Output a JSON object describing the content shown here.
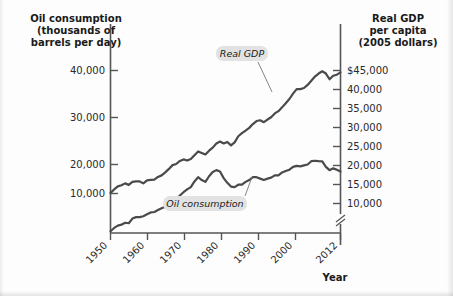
{
  "chart_data": {
    "type": "line",
    "title": "",
    "xlabel": "Year",
    "ylabel_left": "Oil consumption (thousands of barrels per day)",
    "ylabel_right": "Real GDP per capita (2005 dollars)",
    "grid": false,
    "legend_position": "inline-annotations",
    "xlim": [
      1949,
      2012
    ],
    "x_ticks": [
      "1950",
      "1960",
      "1970",
      "1980",
      "1990",
      "2000",
      "2012"
    ],
    "x_tick_values": [
      1950,
      1960,
      1970,
      1980,
      1990,
      2000,
      2012
    ],
    "left_axis": {
      "ticks": [
        "10,000",
        "20,000",
        "30,000",
        "40,000"
      ],
      "tick_values": [
        10000,
        20000,
        30000,
        40000
      ],
      "ylim": [
        0,
        45000
      ]
    },
    "right_axis": {
      "ticks": [
        "10,000",
        "15,000",
        "20,000",
        "25,000",
        "30,000",
        "35,000",
        "40,000",
        "$45,000"
      ],
      "tick_values": [
        10000,
        15000,
        20000,
        25000,
        30000,
        35000,
        40000,
        45000
      ],
      "ylim": [
        5000,
        47500
      ],
      "axis_break": true
    },
    "series": [
      {
        "name": "Oil consumption",
        "axis": "left",
        "units": "thousands of barrels per day",
        "x": [
          1949,
          1950,
          1951,
          1952,
          1953,
          1954,
          1955,
          1956,
          1957,
          1958,
          1959,
          1960,
          1961,
          1962,
          1963,
          1964,
          1965,
          1966,
          1967,
          1968,
          1969,
          1970,
          1971,
          1972,
          1973,
          1974,
          1975,
          1976,
          1977,
          1978,
          1979,
          1980,
          1981,
          1982,
          1983,
          1984,
          1985,
          1986,
          1987,
          1988,
          1989,
          1990,
          1991,
          1992,
          1993,
          1994,
          1995,
          1996,
          1997,
          1998,
          1999,
          2000,
          2001,
          2002,
          2003,
          2004,
          2005,
          2006,
          2007,
          2008,
          2009,
          2010,
          2011,
          2012
        ],
        "values": [
          5800,
          6500,
          7000,
          7200,
          7600,
          7500,
          8500,
          8800,
          8800,
          9000,
          9400,
          9800,
          9900,
          10300,
          10700,
          11000,
          11500,
          12100,
          12600,
          13400,
          14100,
          14700,
          15200,
          16400,
          17300,
          16700,
          16300,
          17500,
          18400,
          18800,
          18500,
          17100,
          16100,
          15300,
          15200,
          15700,
          15700,
          16300,
          16700,
          17300,
          17300,
          17000,
          16700,
          17000,
          17200,
          17700,
          17700,
          18300,
          18600,
          18900,
          19500,
          19700,
          19600,
          19800,
          20000,
          20700,
          20800,
          20700,
          20680,
          19500,
          18800,
          19180,
          18880,
          18490
        ]
      },
      {
        "name": "Real GDP",
        "axis": "right",
        "units": "2005 dollars per capita",
        "x": [
          1949,
          1950,
          1951,
          1952,
          1953,
          1954,
          1955,
          1956,
          1957,
          1958,
          1959,
          1960,
          1961,
          1962,
          1963,
          1964,
          1965,
          1966,
          1967,
          1968,
          1969,
          1970,
          1971,
          1972,
          1973,
          1974,
          1975,
          1976,
          1977,
          1978,
          1979,
          1980,
          1981,
          1982,
          1983,
          1984,
          1985,
          1986,
          1987,
          1988,
          1989,
          1990,
          1991,
          1992,
          1993,
          1994,
          1995,
          1996,
          1997,
          1998,
          1999,
          2000,
          2001,
          2002,
          2003,
          2004,
          2005,
          2006,
          2007,
          2008,
          2009,
          2010,
          2011,
          2012
        ],
        "values": [
          12800,
          13700,
          14500,
          14800,
          15300,
          14900,
          15700,
          15800,
          15800,
          15300,
          16100,
          16200,
          16300,
          17000,
          17400,
          18200,
          19100,
          20100,
          20400,
          21200,
          21600,
          21300,
          21700,
          22700,
          23700,
          23300,
          22900,
          23900,
          24700,
          25800,
          26300,
          25800,
          26200,
          25300,
          26100,
          27700,
          28500,
          29200,
          29900,
          30900,
          31700,
          31900,
          31400,
          32100,
          32700,
          33700,
          34300,
          35300,
          36400,
          37500,
          38900,
          40100,
          40100,
          40400,
          41200,
          42300,
          43400,
          44200,
          44800,
          44200,
          42700,
          43600,
          43900,
          44500
        ]
      }
    ],
    "annotations": [
      {
        "text": "Real GDP",
        "series": "Real GDP"
      },
      {
        "text": "Oil consumption",
        "series": "Oil consumption"
      }
    ]
  },
  "labels": {
    "left_title_line1": "Oil consumption",
    "left_title_line2": "(thousands of",
    "left_title_line3": "barrels per day)",
    "right_title_line1": "Real GDP",
    "right_title_line2": "per capita",
    "right_title_line3": "(2005 dollars)",
    "x_axis_name": "Year",
    "left_ticks": [
      "40,000",
      "30,000",
      "20,000",
      "10,000"
    ],
    "right_ticks": [
      "$45,000",
      "40,000",
      "35,000",
      "30,000",
      "25,000",
      "20,000",
      "15,000",
      "10,000"
    ],
    "x_ticks": [
      "1950",
      "1960",
      "1970",
      "1980",
      "1990",
      "2000",
      "2012"
    ],
    "series_gdp": "Real GDP",
    "series_oil": "Oil consumption"
  },
  "colors": {
    "line": "#4a4a4a",
    "axis": "#555555",
    "badge": "#e2e2e2",
    "text": "#1a1a1a",
    "background": "#fdfdfd"
  }
}
